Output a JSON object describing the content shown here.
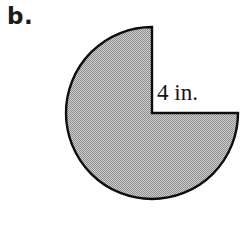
{
  "figure": {
    "part_label": "b.",
    "radius_label": "4 in.",
    "shape_name": "circle-with-quarter-wedge-removed",
    "fill_color": "#b0b0b0",
    "stroke_color": "#000000",
    "background_color": "#ffffff",
    "center_x": 152,
    "center_y": 113,
    "radius_px": 86,
    "removed_sector_degrees": 90,
    "removed_sector_start_degrees": 0,
    "removed_sector_end_degrees": 90,
    "radius_value": 4,
    "radius_units": "in."
  },
  "chart_data": {
    "type": "pie",
    "title": "b.",
    "categories": [
      "shaded region",
      "removed wedge"
    ],
    "values": [
      270,
      90
    ],
    "value_units": "degrees",
    "annotations": [
      "4 in."
    ],
    "xlabel": "",
    "ylabel": "",
    "legend": "none",
    "grid": false
  }
}
